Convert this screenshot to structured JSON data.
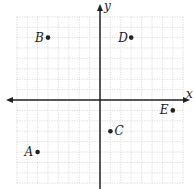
{
  "chart_data": {
    "type": "scatter",
    "title": "",
    "xlabel": "x",
    "ylabel": "y",
    "xlim": [
      -8,
      8
    ],
    "ylim": [
      -8,
      8
    ],
    "grid": true,
    "grid_style": "dotted",
    "legend": "none",
    "points": [
      {
        "label": "A",
        "x": -6,
        "y": -5,
        "label_side": "left"
      },
      {
        "label": "B",
        "x": -5,
        "y": 6,
        "label_side": "left"
      },
      {
        "label": "C",
        "x": 1,
        "y": -3,
        "label_side": "right"
      },
      {
        "label": "D",
        "x": 3,
        "y": 6,
        "label_side": "left"
      },
      {
        "label": "E",
        "x": 7,
        "y": -1,
        "label_side": "left"
      }
    ]
  },
  "axes": {
    "x_label": "x",
    "y_label": "y"
  },
  "colors": {
    "grid": "#b8b8b8",
    "axis": "#222222",
    "point": "#222222",
    "background": "#ffffff"
  }
}
